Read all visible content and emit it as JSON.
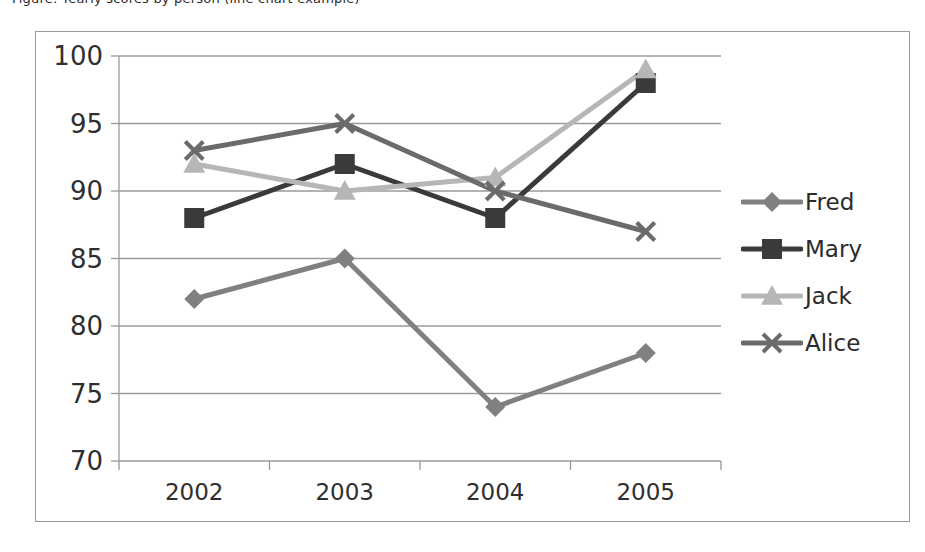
{
  "caption": {
    "text": "Figure: Yearly scores by person (line chart example)"
  },
  "chart_data": {
    "type": "line",
    "title": "",
    "subtitle": "",
    "xlabel": "",
    "ylabel": "",
    "categories": [
      "2002",
      "2003",
      "2004",
      "2005"
    ],
    "series": [
      {
        "name": "Fred",
        "values": [
          82,
          85,
          74,
          78
        ],
        "color": "#808080",
        "marker": "diamond"
      },
      {
        "name": "Mary",
        "values": [
          88,
          92,
          88,
          98
        ],
        "color": "#3a3a3a",
        "marker": "square"
      },
      {
        "name": "Jack",
        "values": [
          92,
          90,
          91,
          99
        ],
        "color": "#b6b6b6",
        "marker": "triangle"
      },
      {
        "name": "Alice",
        "values": [
          93,
          95,
          90,
          87
        ],
        "color": "#6b6b6b",
        "marker": "x"
      }
    ],
    "ylim": [
      70,
      100
    ],
    "yticks": [
      70,
      75,
      80,
      85,
      90,
      95,
      100
    ],
    "ytick_labels": [
      "70",
      "75",
      "80",
      "85",
      "90",
      "95",
      "100"
    ],
    "grid": true,
    "grid_color": "#9a9a9a",
    "legend_position": "right",
    "legend_entries": [
      "Fred",
      "Mary",
      "Jack",
      "Alice"
    ],
    "plot_background": "#ffffff",
    "frame_color": "#9a9a9a"
  }
}
